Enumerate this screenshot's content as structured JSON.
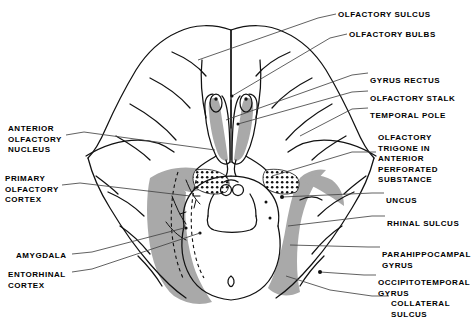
{
  "figure": {
    "width": 473,
    "height": 320,
    "background_color": "#ffffff",
    "ink_color": "#000000",
    "shade_color": "#a9a9a9",
    "stipple_color": "#000000"
  },
  "labels": {
    "right": [
      {
        "id": "olfactory-sulcus",
        "text": "OLFACTORY SULCUS",
        "x": 338,
        "y": 10
      },
      {
        "id": "olfactory-bulbs",
        "text": "OLFACTORY BULBS",
        "x": 349,
        "y": 30
      },
      {
        "id": "gyrus-rectus",
        "text": "GYRUS RECTUS",
        "x": 370,
        "y": 76
      },
      {
        "id": "olfactory-stalk",
        "text": "OLFACTORY STALK",
        "x": 370,
        "y": 94
      },
      {
        "id": "temporal-pole",
        "text": "TEMPORAL POLE",
        "x": 370,
        "y": 111
      },
      {
        "id": "olfactory-trigone",
        "text": "OLFACTORY\nTRIGONE IN\nANTERIOR\nPERFORATED\nSUBSTANCE",
        "x": 378,
        "y": 133
      },
      {
        "id": "uncus",
        "text": "UNCUS",
        "x": 386,
        "y": 196
      },
      {
        "id": "rhinal-sulcus",
        "text": "RHINAL SULCUS",
        "x": 387,
        "y": 219
      },
      {
        "id": "parahippocampal-gyrus",
        "text": "PARAHIPPOCAMPAL\nGYRUS",
        "x": 382,
        "y": 250
      },
      {
        "id": "occipitotemporal-gyrus",
        "text": "OCCIPITOTEMPORAL\nGYRUS",
        "x": 378,
        "y": 278
      },
      {
        "id": "collateral-sulcus",
        "text": "COLLATERAL\nSULCUS",
        "x": 391,
        "y": 299
      }
    ],
    "left": [
      {
        "id": "anterior-olfactory-nucleus",
        "text": "ANTERIOR\nOLFACTORY\nNUCLEUS",
        "x": 8,
        "y": 124
      },
      {
        "id": "primary-olfactory-cortex",
        "text": "PRIMARY\nOLFACTORY\nCORTEX",
        "x": 5,
        "y": 174
      },
      {
        "id": "amygdala",
        "text": "AMYGDALA",
        "x": 16,
        "y": 251
      },
      {
        "id": "entorhinal-cortex",
        "text": "ENTORHINAL\nCORTEX",
        "x": 8,
        "y": 270
      }
    ]
  },
  "leaders": {
    "olfactory-sulcus": "M 336,14 L 318,18 L 198,60",
    "olfactory-bulbs": "M 347,34 L 330,38 L 232,96",
    "gyrus-rectus": "M 368,73 L 352,75 L 226,120",
    "olfactory-stalk": "M 368,91 L 352,92 L 238,124",
    "temporal-pole": "M 368,108 L 352,109 L 300,136",
    "olfactory-trigone": "M 376,152 L 352,152 L 272,176",
    "uncus": "M 384,193 L 372,193 L 282,197",
    "rhinal-sulcus": "M 385,216 L 372,216 L 288,226",
    "parahippocampal-gyrus": "M 380,247 L 368,247 L 290,245",
    "occipitotemporal-gyrus": "M 376,275 L 364,275 L 320,272",
    "collateral-sulcus": "M 389,296 L 372,296 L 330,290 L 286,276",
    "anterior-olfactory-nucleus": "M 66,135 L 84,132 L 215,150",
    "primary-olfactory-cortex": "M 62,185 L 80,183 L 190,196",
    "amygdala": "M 72,254 L 92,252 L 184,228",
    "entorhinal-cortex": "M 72,272 L 92,269 L 200,233"
  },
  "anatomy": {
    "note": "Line drawing of the inferior (ventral) surface of the cerebrum with brainstem, showing paired olfactory bulbs and tracts, shaded primary olfactory / entorhinal cortex, and stippled anterior perforated substance."
  }
}
